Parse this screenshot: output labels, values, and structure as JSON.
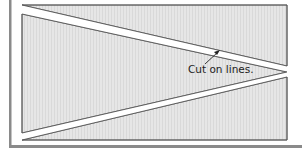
{
  "diagram": {
    "annotation": {
      "text": "Cut on lines.",
      "arrow_target": "upper-cut-strip"
    },
    "colors": {
      "panel_fill": "#e4e4e4",
      "hatch": "#d6d6d6",
      "line": "#555555",
      "border_bar": "#8a8a8a",
      "cut_strip": "#ffffff",
      "text": "#222222"
    },
    "shapes": [
      {
        "name": "upper-cut-strip",
        "description": "white wedge strip running from top-left to right vertex"
      },
      {
        "name": "lower-cut-strip",
        "description": "white wedge strip running from right vertex to bottom-left"
      },
      {
        "name": "top-panel",
        "description": "hatched triangular region above upper strip"
      },
      {
        "name": "middle-panel",
        "description": "hatched wedge region between strips"
      },
      {
        "name": "bottom-panel",
        "description": "hatched triangular region below lower strip"
      }
    ]
  }
}
